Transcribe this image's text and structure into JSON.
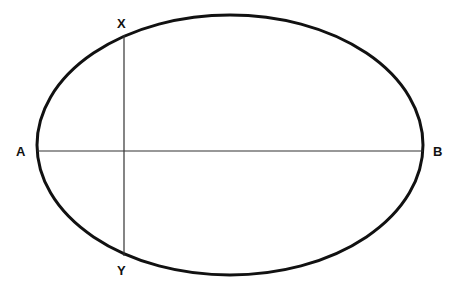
{
  "diagram": {
    "type": "ellipse-with-axes",
    "colors": {
      "stroke": "#111111",
      "axis": "#333333",
      "background": "#ffffff"
    },
    "ellipse": {
      "cx": 230,
      "cy": 145,
      "rx": 193,
      "ry": 130,
      "stroke_width": 3
    },
    "major_axis": {
      "x1": 37,
      "y1": 151,
      "x2": 423,
      "y2": 151,
      "stroke_width": 1.2
    },
    "chord": {
      "x1": 124,
      "y1": 35,
      "x2": 124,
      "y2": 256,
      "stroke_width": 1.2
    },
    "labels": {
      "a": {
        "text": "A",
        "x": 16,
        "y": 156
      },
      "b": {
        "text": "B",
        "x": 433,
        "y": 156
      },
      "x": {
        "text": "X",
        "x": 117,
        "y": 28
      },
      "y": {
        "text": "Y",
        "x": 117,
        "y": 275
      }
    }
  }
}
